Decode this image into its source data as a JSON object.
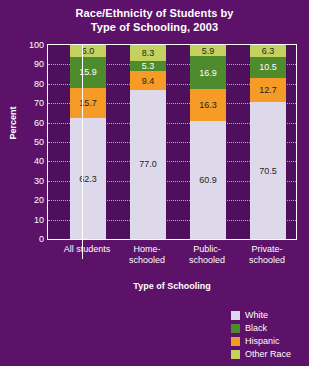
{
  "chart_data": {
    "type": "bar",
    "title": "Race/Ethnicity of Students by Type of Schooling, 2003",
    "title_line1": "Race/Ethnicity of Students by",
    "title_line2": "Type of Schooling, 2003",
    "xlabel": "Type of Schooling",
    "ylabel": "Percent",
    "ylim": [
      0,
      100
    ],
    "yticks": [
      100,
      90,
      80,
      70,
      60,
      50,
      40,
      30,
      20,
      10,
      0
    ],
    "grid": true,
    "stacked": true,
    "legend_position": "bottom-right",
    "categories": [
      {
        "label": "All students",
        "line1": "All students",
        "line2": ""
      },
      {
        "label": "Home-schooled",
        "line1": "Home-",
        "line2": "schooled"
      },
      {
        "label": "Public-schooled",
        "line1": "Public-",
        "line2": "schooled"
      },
      {
        "label": "Private-schooled",
        "line1": "Private-",
        "line2": "schooled"
      }
    ],
    "series": [
      {
        "name": "White",
        "key": "white",
        "color": "#ded9ea",
        "values": [
          62.3,
          77.0,
          60.9,
          70.5
        ]
      },
      {
        "name": "Black",
        "key": "black",
        "color": "#4d8b2c",
        "values": [
          15.9,
          5.3,
          16.9,
          10.5
        ]
      },
      {
        "name": "Hispanic",
        "key": "hisp",
        "color": "#f59b26",
        "values": [
          15.7,
          9.4,
          16.3,
          12.7
        ]
      },
      {
        "name": "Other Race",
        "key": "other",
        "color": "#c3d25e",
        "values": [
          6.0,
          8.3,
          5.9,
          6.3
        ]
      }
    ],
    "stack_order_bottom_to_top": [
      "White",
      "Hispanic",
      "Black",
      "Other Race"
    ],
    "colors": {
      "background": "#5c1268",
      "plot_background": "#4e0f5c",
      "axis": "#ffffff",
      "gridline": "#d9b9e0",
      "text": "#ffffff",
      "data_label": "#231f20"
    }
  }
}
